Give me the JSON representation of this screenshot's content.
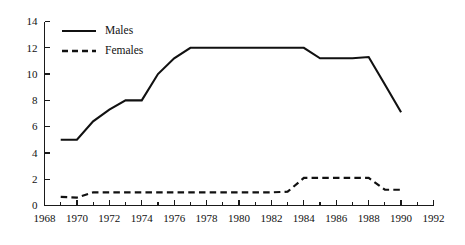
{
  "chart_data": {
    "type": "line",
    "title": "",
    "subtitle": "",
    "xlabel": "",
    "ylabel": "",
    "xlim": [
      1968,
      1992
    ],
    "ylim": [
      0,
      14
    ],
    "grid": false,
    "legend_position": "top-left",
    "y_ticks": [
      0,
      2,
      4,
      6,
      8,
      10,
      12,
      14
    ],
    "y_tick_labels": [
      "0",
      "2",
      "4",
      "6",
      "8",
      "10",
      "12",
      "14"
    ],
    "x_ticks": [
      1968,
      1970,
      1972,
      1974,
      1976,
      1978,
      1980,
      1982,
      1984,
      1986,
      1988,
      1990,
      1992
    ],
    "x_tick_labels": [
      "1968",
      "1970",
      "1972",
      "1974",
      "1976",
      "1978",
      "1980",
      "1982",
      "1984",
      "1986",
      "1988",
      "1990",
      "1992"
    ],
    "x_minor_ticks": [
      1969,
      1971,
      1973,
      1975,
      1977,
      1979,
      1981,
      1983,
      1985,
      1987,
      1989,
      1991
    ],
    "series": [
      {
        "name": "Males",
        "style": "solid",
        "color": "#111111",
        "x": [
          1969,
          1970,
          1971,
          1972,
          1973,
          1974,
          1975,
          1976,
          1977,
          1978,
          1979,
          1980,
          1981,
          1982,
          1983,
          1984,
          1985,
          1986,
          1987,
          1988,
          1989,
          1990
        ],
        "values": [
          5.0,
          5.0,
          6.4,
          7.3,
          8.0,
          8.0,
          10.0,
          11.2,
          12.0,
          12.0,
          12.0,
          12.0,
          12.0,
          12.0,
          12.0,
          12.0,
          11.2,
          11.2,
          11.2,
          11.3,
          9.2,
          7.1
        ]
      },
      {
        "name": "Females",
        "style": "dashed",
        "color": "#111111",
        "x": [
          1969,
          1970,
          1971,
          1972,
          1973,
          1974,
          1975,
          1976,
          1977,
          1978,
          1979,
          1980,
          1981,
          1982,
          1983,
          1984,
          1985,
          1986,
          1987,
          1988,
          1989,
          1990
        ],
        "values": [
          0.65,
          0.6,
          1.0,
          1.0,
          1.0,
          1.0,
          1.0,
          1.0,
          1.0,
          1.0,
          1.0,
          1.0,
          1.0,
          1.0,
          1.05,
          2.1,
          2.1,
          2.1,
          2.1,
          2.1,
          1.2,
          1.2
        ]
      }
    ],
    "legend": [
      {
        "label": "Males",
        "style": "solid"
      },
      {
        "label": "Females",
        "style": "dashed"
      }
    ]
  }
}
